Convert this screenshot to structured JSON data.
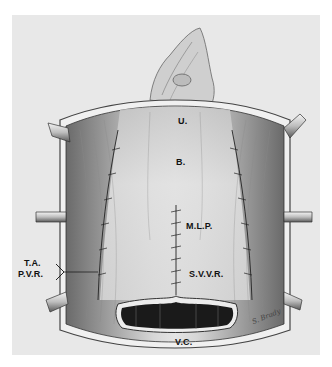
{
  "figure": {
    "type": "surgical-illustration",
    "background_color": "#e8e8e8",
    "labels": {
      "u": "U.",
      "b": "B.",
      "mlp": "M.L.P.",
      "ta": "T.A.",
      "pvr": "P.V.R.",
      "svvr": "S.V.V.R.",
      "vc": "V.C."
    },
    "signature": "S. Brady"
  }
}
